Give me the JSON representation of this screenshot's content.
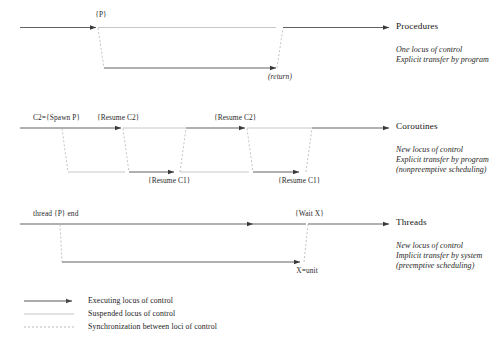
{
  "figure": {
    "background_color": "#ffffff",
    "line_color_solid": "#3a3a3a",
    "line_color_suspended": "#b9b9b9",
    "line_color_dashed": "#b0aeb0"
  },
  "sections": [
    {
      "id": "procedures",
      "title": "Procedures",
      "description": [
        "One locus of control",
        "Explicit transfer by program"
      ],
      "labels": [
        {
          "name": "call-label",
          "text": "{P}"
        },
        {
          "name": "return-label",
          "text": "(return)"
        }
      ]
    },
    {
      "id": "coroutines",
      "title": "Coroutines",
      "description": [
        "New locus of control",
        "Explicit transfer by program",
        "(nonpreemptive scheduling)"
      ],
      "labels": [
        {
          "name": "spawn-label",
          "text": "C2={Spawn P}"
        },
        {
          "name": "resume-c2-label-1",
          "text": "{Resume C2}"
        },
        {
          "name": "resume-c2-label-2",
          "text": "{Resume C2}"
        },
        {
          "name": "resume-c1-label-1",
          "text": "{Resume C1}"
        },
        {
          "name": "resume-c1-label-2",
          "text": "{Resume C1}"
        }
      ]
    },
    {
      "id": "threads",
      "title": "Threads",
      "description": [
        "New locus of control",
        "Implicit transfer by system",
        "(preemptive scheduling)"
      ],
      "labels": [
        {
          "name": "thread-spawn-label",
          "text": "thread {P} end"
        },
        {
          "name": "wait-label",
          "text": "{Wait X}"
        },
        {
          "name": "xunit-label",
          "text": "X=unit"
        }
      ]
    }
  ],
  "legend": {
    "items": [
      {
        "style": "solid-arrow",
        "label": "Executing locus of control"
      },
      {
        "style": "faint-line",
        "label": "Suspended locus of control"
      },
      {
        "style": "dashed-line",
        "label": "Synchronization between loci of control"
      }
    ]
  }
}
